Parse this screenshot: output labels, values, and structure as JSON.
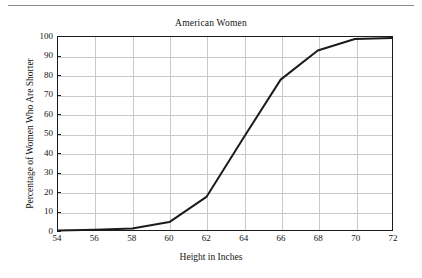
{
  "figure": {
    "title": "American Women",
    "background_color": "#ffffff",
    "rule_color": "#8a8a8a"
  },
  "chart_data": {
    "type": "line",
    "title": "American Women",
    "xlabel": "Height in Inches",
    "ylabel": "Percentage of Women Who Are Shorter",
    "xlim": [
      54,
      72
    ],
    "ylim": [
      0,
      100
    ],
    "xticks": [
      54,
      56,
      58,
      60,
      62,
      64,
      66,
      68,
      70,
      72
    ],
    "yticks": [
      0,
      10,
      20,
      30,
      40,
      50,
      60,
      70,
      80,
      90,
      100
    ],
    "grid": true,
    "legend": "none",
    "line_color": "#1b1b1b",
    "grid_color": "#c9c9c9",
    "series": [
      {
        "name": "Cumulative percentage shorter",
        "x": [
          54,
          56,
          58,
          60,
          62,
          64,
          66,
          68,
          70,
          72
        ],
        "values": [
          0.2,
          0.5,
          1.2,
          4.5,
          17.5,
          48,
          78,
          93,
          99,
          99.5
        ]
      }
    ]
  }
}
